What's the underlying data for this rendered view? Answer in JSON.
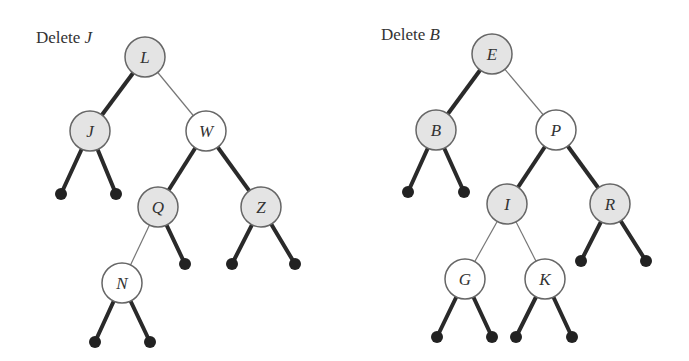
{
  "trees": [
    {
      "title_prefix": "Delete",
      "title_key": "J",
      "nodes": [
        {
          "id": "L",
          "label": "L",
          "x": 145,
          "y": 57,
          "fill": "gray"
        },
        {
          "id": "J",
          "label": "J",
          "x": 90,
          "y": 131,
          "fill": "gray"
        },
        {
          "id": "W",
          "label": "W",
          "x": 206,
          "y": 131,
          "fill": "white"
        },
        {
          "id": "Q",
          "label": "Q",
          "x": 158,
          "y": 207,
          "fill": "gray"
        },
        {
          "id": "Z",
          "label": "Z",
          "x": 261,
          "y": 207,
          "fill": "gray"
        },
        {
          "id": "N",
          "label": "N",
          "x": 122,
          "y": 283,
          "fill": "white"
        }
      ],
      "edges": [
        {
          "from": "L",
          "to": "J",
          "style": "thick"
        },
        {
          "from": "L",
          "to": "W",
          "style": "thin"
        },
        {
          "from": "W",
          "to": "Q",
          "style": "thick"
        },
        {
          "from": "W",
          "to": "Z",
          "style": "thick"
        },
        {
          "from": "Q",
          "to": "N",
          "style": "thin"
        }
      ],
      "leaves": [
        {
          "parent": "J",
          "x": 61,
          "y": 194
        },
        {
          "parent": "J",
          "x": 116,
          "y": 194
        },
        {
          "parent": "Q",
          "x": 185,
          "y": 264
        },
        {
          "parent": "Z",
          "x": 232,
          "y": 264
        },
        {
          "parent": "Z",
          "x": 295,
          "y": 264
        },
        {
          "parent": "N",
          "x": 95,
          "y": 342
        },
        {
          "parent": "N",
          "x": 150,
          "y": 342
        }
      ]
    },
    {
      "title_prefix": "Delete",
      "title_key": "B",
      "nodes": [
        {
          "id": "E",
          "label": "E",
          "x": 492,
          "y": 54,
          "fill": "gray"
        },
        {
          "id": "B",
          "label": "B",
          "x": 436,
          "y": 130,
          "fill": "gray"
        },
        {
          "id": "P",
          "label": "P",
          "x": 556,
          "y": 130,
          "fill": "white"
        },
        {
          "id": "I",
          "label": "I",
          "x": 507,
          "y": 204,
          "fill": "gray"
        },
        {
          "id": "R",
          "label": "R",
          "x": 610,
          "y": 204,
          "fill": "gray"
        },
        {
          "id": "G",
          "label": "G",
          "x": 465,
          "y": 279,
          "fill": "white"
        },
        {
          "id": "K",
          "label": "K",
          "x": 545,
          "y": 279,
          "fill": "white"
        }
      ],
      "edges": [
        {
          "from": "E",
          "to": "B",
          "style": "thick"
        },
        {
          "from": "E",
          "to": "P",
          "style": "thin"
        },
        {
          "from": "P",
          "to": "I",
          "style": "thick"
        },
        {
          "from": "P",
          "to": "R",
          "style": "thick"
        },
        {
          "from": "I",
          "to": "G",
          "style": "thin"
        },
        {
          "from": "I",
          "to": "K",
          "style": "thin"
        }
      ],
      "leaves": [
        {
          "parent": "B",
          "x": 408,
          "y": 192
        },
        {
          "parent": "B",
          "x": 464,
          "y": 192
        },
        {
          "parent": "R",
          "x": 581,
          "y": 261
        },
        {
          "parent": "R",
          "x": 646,
          "y": 261
        },
        {
          "parent": "G",
          "x": 437,
          "y": 337
        },
        {
          "parent": "G",
          "x": 492,
          "y": 337
        },
        {
          "parent": "K",
          "x": 516,
          "y": 337
        },
        {
          "parent": "K",
          "x": 572,
          "y": 337
        }
      ]
    }
  ],
  "style": {
    "gray_fill": "#e4e4e4",
    "white_fill": "#ffffff",
    "node_stroke": "#666666",
    "thick_edge": "#2a2a2a",
    "thin_edge": "#777777",
    "leaf_fill": "#222222"
  }
}
